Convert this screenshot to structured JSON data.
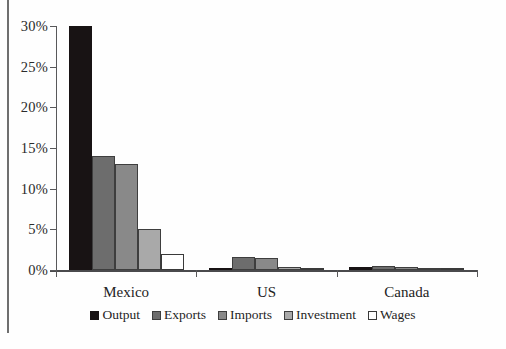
{
  "chart_data": {
    "type": "bar",
    "title": "",
    "subtitle": "",
    "xlabel": "",
    "ylabel": "",
    "categories": [
      "Mexico",
      "US",
      "Canada"
    ],
    "series": [
      {
        "name": "Output",
        "color": "#181314",
        "values": [
          30.0,
          0.3,
          0.4
        ]
      },
      {
        "name": "Exports",
        "color": "#6d6d6d",
        "values": [
          14.0,
          1.6,
          0.5
        ]
      },
      {
        "name": "Imports",
        "color": "#898989",
        "values": [
          13.0,
          1.5,
          0.4
        ]
      },
      {
        "name": "Investment",
        "color": "#a9a9a9",
        "values": [
          5.0,
          0.4,
          0.3
        ]
      },
      {
        "name": "Wages",
        "color": "#ffffff",
        "values": [
          2.0,
          0.3,
          0.2
        ]
      }
    ],
    "ylim": [
      0,
      30
    ],
    "yticks": [
      0,
      5,
      10,
      15,
      20,
      25,
      30
    ],
    "ytick_labels": [
      "0%",
      "5%",
      "10%",
      "15%",
      "20%",
      "25%",
      "30%"
    ],
    "grid": false,
    "legend_position": "bottom",
    "legend_entries": [
      "Output",
      "Exports",
      "Imports",
      "Investment",
      "Wages"
    ]
  }
}
